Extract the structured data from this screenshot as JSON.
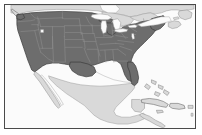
{
  "figure": {
    "name": "north-america-thematic-map",
    "frame": {
      "border_color": "#4a4a4a",
      "border_width_px": 1,
      "margin_px": 4
    }
  },
  "legend_colors": {
    "highlighted_country_fill": "#6d6d6d",
    "highlighted_country_stroke": "#3a3a3a",
    "state_boundary_stroke": "#8f8f8f",
    "other_land_fill": "#d9d9d9",
    "other_land_stroke": "#9a9a9a",
    "lake_fill": "#fbfbfb",
    "lake_stroke": "#9a9a9a",
    "ocean_fill": "#fbfbfb"
  },
  "regions": [
    {
      "name": "united-states-contiguous",
      "label": "United States (contiguous)",
      "style": "highlighted",
      "fill": "#6d6d6d"
    },
    {
      "name": "canada",
      "label": "Canada",
      "style": "other-land",
      "fill": "#d9d9d9"
    },
    {
      "name": "mexico",
      "label": "Mexico",
      "style": "other-land",
      "fill": "#d9d9d9"
    },
    {
      "name": "central-america",
      "label": "Central America",
      "style": "other-land",
      "fill": "#d9d9d9"
    },
    {
      "name": "cuba",
      "label": "Cuba",
      "style": "other-land",
      "fill": "#d9d9d9"
    },
    {
      "name": "bahamas",
      "label": "Bahamas",
      "style": "other-land",
      "fill": "#d9d9d9"
    },
    {
      "name": "hispaniola",
      "label": "Hispaniola",
      "style": "other-land",
      "fill": "#d9d9d9"
    },
    {
      "name": "jamaica",
      "label": "Jamaica",
      "style": "other-land",
      "fill": "#d9d9d9"
    },
    {
      "name": "puerto-rico",
      "label": "Puerto Rico",
      "style": "other-land",
      "fill": "#d9d9d9"
    },
    {
      "name": "vancouver-island",
      "label": "Vancouver Island",
      "style": "other-land",
      "fill": "#d9d9d9"
    },
    {
      "name": "nova-scotia",
      "label": "Nova Scotia",
      "style": "other-land",
      "fill": "#d9d9d9"
    },
    {
      "name": "newfoundland",
      "label": "Newfoundland",
      "style": "other-land",
      "fill": "#d9d9d9"
    },
    {
      "name": "baja-california",
      "label": "Baja California",
      "style": "other-land",
      "fill": "#d9d9d9"
    }
  ],
  "lakes": [
    {
      "name": "lake-superior",
      "label": "Lake Superior"
    },
    {
      "name": "lake-michigan",
      "label": "Lake Michigan"
    },
    {
      "name": "lake-huron",
      "label": "Lake Huron"
    },
    {
      "name": "lake-erie",
      "label": "Lake Erie"
    },
    {
      "name": "lake-ontario",
      "label": "Lake Ontario"
    },
    {
      "name": "great-salt-lake",
      "label": "Great Salt Lake"
    }
  ],
  "annotations": {
    "text_labels": [],
    "legend_present": false,
    "scale_bar_present": false,
    "north_arrow_present": false,
    "gridlines_present": false
  }
}
